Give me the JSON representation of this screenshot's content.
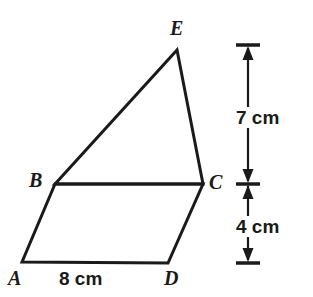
{
  "figure": {
    "kind": "composite-geometry-figure",
    "background_color": "#ffffff",
    "stroke_color": "#1a1a1a",
    "stroke_width": 3
  },
  "vertices": {
    "A": {
      "label": "A",
      "x": 22,
      "y": 262
    },
    "B": {
      "label": "B",
      "x": 55,
      "y": 184
    },
    "C": {
      "label": "C",
      "x": 203,
      "y": 184
    },
    "D": {
      "label": "D",
      "x": 168,
      "y": 263
    },
    "E": {
      "label": "E",
      "x": 177,
      "y": 50
    }
  },
  "shapes": {
    "parallelogram": {
      "name": "ABCD",
      "points": "22,262 55,184 203,184 168,263"
    },
    "triangle": {
      "name": "BEC",
      "points": "55,184 177,50 203,184"
    }
  },
  "dimensions": {
    "base": {
      "label": "8 cm",
      "value": 8,
      "unit": "cm",
      "measures": "AD"
    },
    "upper_height": {
      "label": "7 cm",
      "value": 7,
      "unit": "cm",
      "measures": "height of triangle BEC"
    },
    "lower_height": {
      "label": "4 cm",
      "value": 4,
      "unit": "cm",
      "measures": "height of parallelogram ABCD"
    }
  },
  "dimension_line": {
    "x": 248,
    "tick_top_y": 45,
    "tick_middle_y": 184,
    "tick_bottom_y": 263,
    "tick_half_width": 12
  }
}
